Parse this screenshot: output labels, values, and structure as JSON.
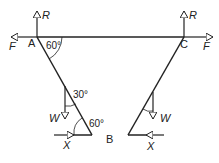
{
  "diagram": {
    "type": "ladder-force-diagram",
    "points": {
      "A": "A",
      "B": "B",
      "C": "C"
    },
    "forces": {
      "reaction": "R",
      "friction": "F",
      "weight": "W",
      "horizontal": "X"
    },
    "angles": {
      "at_A": "60°",
      "weight_angle": "30°",
      "at_B": "60°"
    },
    "colors": {
      "stroke": "#222222",
      "background": "#ffffff"
    }
  }
}
